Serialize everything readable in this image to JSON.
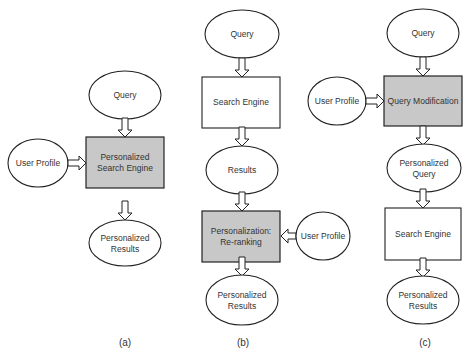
{
  "colors": {
    "stroke": "#222222",
    "shaded_fill": "#c8c8c8",
    "plain_fill": "#ffffff",
    "text": "#333333"
  },
  "panels": [
    {
      "caption": "(a)",
      "nodes": {
        "query": {
          "shape": "ellipse",
          "lines": [
            "Query"
          ]
        },
        "user_profile": {
          "shape": "ellipse",
          "lines": [
            "User Profile"
          ]
        },
        "engine": {
          "shape": "shaded-box",
          "lines": [
            "Personalized",
            "Search Engine"
          ]
        },
        "results": {
          "shape": "ellipse",
          "lines": [
            "Personalized",
            "Results"
          ]
        }
      }
    },
    {
      "caption": "(b)",
      "nodes": {
        "query": {
          "shape": "ellipse",
          "lines": [
            "Query"
          ]
        },
        "engine": {
          "shape": "box",
          "lines": [
            "Search Engine"
          ]
        },
        "results": {
          "shape": "ellipse",
          "lines": [
            "Results"
          ]
        },
        "rerank": {
          "shape": "shaded-box",
          "lines": [
            "Personalization:",
            "Re-ranking"
          ]
        },
        "user_profile": {
          "shape": "ellipse",
          "lines": [
            "User Profile"
          ]
        },
        "final": {
          "shape": "ellipse",
          "lines": [
            "Personalized",
            "Results"
          ]
        }
      }
    },
    {
      "caption": "(c)",
      "nodes": {
        "query": {
          "shape": "ellipse",
          "lines": [
            "Query"
          ]
        },
        "user_profile": {
          "shape": "ellipse",
          "lines": [
            "User Profile"
          ]
        },
        "modification": {
          "shape": "shaded-box",
          "lines": [
            "Query Modification"
          ]
        },
        "pquery": {
          "shape": "ellipse",
          "lines": [
            "Personalized",
            "Query"
          ]
        },
        "engine": {
          "shape": "box",
          "lines": [
            "Search Engine"
          ]
        },
        "final": {
          "shape": "ellipse",
          "lines": [
            "Personalized",
            "Results"
          ]
        }
      }
    }
  ]
}
